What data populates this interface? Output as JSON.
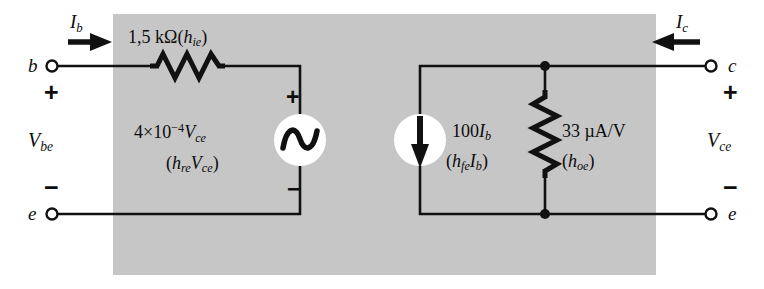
{
  "figure": {
    "kind": "h-parameter-equivalent-circuit",
    "panel_color": "#c6c6c6",
    "wire_color": "#111111",
    "source_fill": "#ffffff"
  },
  "terminals": {
    "base": "b",
    "emitter_left": "e",
    "collector": "c",
    "emitter_right": "e"
  },
  "currents": {
    "input": {
      "symbol": "I",
      "sub": "b",
      "direction": "right"
    },
    "output": {
      "symbol": "I",
      "sub": "c",
      "direction": "left"
    }
  },
  "port_voltages": {
    "input": {
      "symbol": "V",
      "sub": "be",
      "plus": "+",
      "minus": "−"
    },
    "output": {
      "symbol": "V",
      "sub": "ce",
      "plus": "+",
      "minus": "−"
    }
  },
  "components": {
    "input_resistance": {
      "value": "1,5 kΩ",
      "param_open": "(",
      "param_symbol": "h",
      "param_sub": "ie",
      "param_close": ")",
      "symbol": "resistor-zigzag"
    },
    "voltage_source": {
      "coefficient": "4",
      "times": "×",
      "base": "10",
      "exponent": "−4",
      "variable": "V",
      "variable_sub": "ce",
      "param_open": "(",
      "param_symbol": "h",
      "param_sub": "re",
      "param_var": "V",
      "param_var_sub": "ce",
      "param_close": ")",
      "plus": "+",
      "minus": "−",
      "symbol": "ac-source-sine"
    },
    "current_source": {
      "gain": "100",
      "variable": "I",
      "variable_sub": "b",
      "param_open": "(",
      "param_symbol": "h",
      "param_sub": "fe",
      "param_var": "I",
      "param_var_sub": "b",
      "param_close": ")",
      "symbol": "current-source-down-arrow"
    },
    "output_conductance": {
      "value": "33 µA/V",
      "param_open": "(",
      "param_symbol": "h",
      "param_sub": "oe",
      "param_close": ")",
      "symbol": "resistor-vertical-zigzag"
    }
  }
}
